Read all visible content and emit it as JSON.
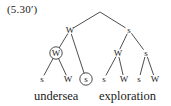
{
  "figure": {
    "example_number": "(5.30′)",
    "caption_left": "undersea",
    "caption_right": "exploration",
    "ink_color": "#3a3a3a",
    "background_color": "#ffffff"
  },
  "tree": {
    "root": {
      "label": "",
      "x": 100,
      "y": 12
    },
    "nodes": [
      {
        "id": "left-top",
        "label": "W",
        "x": 70,
        "y": 30,
        "circled": false
      },
      {
        "id": "right-top",
        "label": "s",
        "x": 129,
        "y": 30,
        "circled": false
      },
      {
        "id": "left-mid-w",
        "label": "W",
        "x": 56,
        "y": 53,
        "circled": true
      },
      {
        "id": "right-mid-w",
        "label": "W",
        "x": 118,
        "y": 53,
        "circled": false
      },
      {
        "id": "right-mid-s",
        "label": "s",
        "x": 146,
        "y": 53,
        "circled": false
      }
    ],
    "leaves": [
      {
        "id": "leaf-1",
        "label": "s",
        "x": 42,
        "y": 79,
        "circled": false
      },
      {
        "id": "leaf-2",
        "label": "W",
        "x": 68,
        "y": 79,
        "circled": false
      },
      {
        "id": "leaf-3",
        "label": "s",
        "x": 86,
        "y": 79,
        "circled": true
      },
      {
        "id": "leaf-4",
        "label": "s",
        "x": 104,
        "y": 79,
        "circled": false
      },
      {
        "id": "leaf-5",
        "label": "W",
        "x": 124,
        "y": 79,
        "circled": false
      },
      {
        "id": "leaf-6",
        "label": "s",
        "x": 139,
        "y": 79,
        "circled": false
      },
      {
        "id": "leaf-7",
        "label": "W",
        "x": 155,
        "y": 79,
        "circled": false
      }
    ],
    "edges": [
      {
        "from": "root",
        "to": "left-top"
      },
      {
        "from": "root",
        "to": "right-top"
      },
      {
        "from": "left-top",
        "to": "left-mid-w"
      },
      {
        "from": "left-top",
        "to": "leaf-3"
      },
      {
        "from": "left-mid-w",
        "to": "leaf-1"
      },
      {
        "from": "left-mid-w",
        "to": "leaf-2"
      },
      {
        "from": "right-top",
        "to": "right-mid-w"
      },
      {
        "from": "right-top",
        "to": "right-mid-s"
      },
      {
        "from": "right-mid-w",
        "to": "leaf-4"
      },
      {
        "from": "right-mid-w",
        "to": "leaf-5"
      },
      {
        "from": "right-mid-s",
        "to": "leaf-6"
      },
      {
        "from": "right-mid-s",
        "to": "leaf-7"
      }
    ]
  }
}
